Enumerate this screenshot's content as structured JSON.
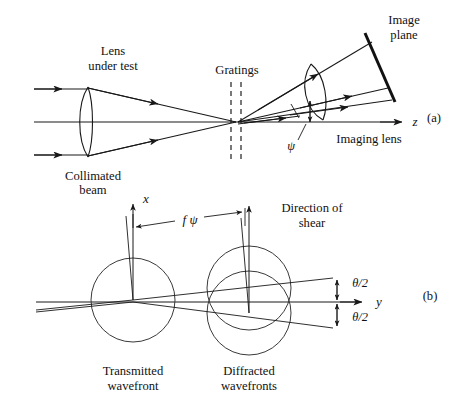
{
  "figure": {
    "background_color": "#ffffff",
    "ink_color": "#181818"
  },
  "panel_a": {
    "tag": "(a)",
    "labels": {
      "lens_under_test_line1": "Lens",
      "lens_under_test_line2": "under test",
      "collimated_beam_line1": "Collimated",
      "collimated_beam_line2": "beam",
      "gratings": "Gratings",
      "image_plane_line1": "Image",
      "image_plane_line2": "plane",
      "imaging_lens": "Imaging lens",
      "psi_symbol": "ψ",
      "axis_z": "z"
    }
  },
  "panel_b": {
    "tag": "(b)",
    "labels": {
      "axis_x": "x",
      "axis_y": "y",
      "f_psi": "f ψ",
      "direction_of_shear_line1": "Direction of",
      "direction_of_shear_line2": "shear",
      "theta_over_two_upper": "θ/2",
      "theta_over_two_lower": "θ/2",
      "transmitted_wavefront_line1": "Transmitted",
      "transmitted_wavefront_line2": "wavefront",
      "diffracted_wavefronts_line1": "Diffracted",
      "diffracted_wavefronts_line2": "wavefronts"
    }
  }
}
